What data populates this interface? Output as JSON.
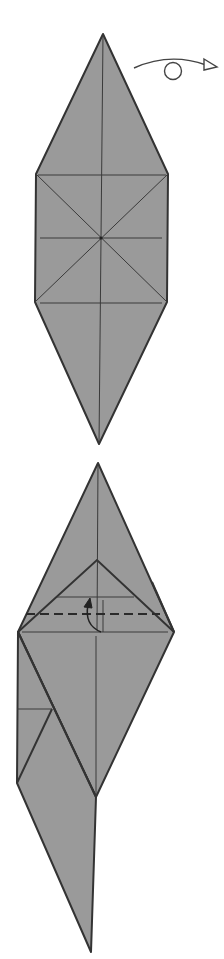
{
  "diagram": {
    "type": "origami-instructions",
    "colors": {
      "paper": "#9a9a9a",
      "edge": "#333333",
      "crease": "#3a3a3a",
      "background": "#ffffff"
    },
    "steps": [
      {
        "id": "step-1",
        "description": "Creased diamond base with turn-over symbol",
        "symbols": [
          "turn-over-arrow"
        ]
      },
      {
        "id": "step-2",
        "description": "Partially folded model with valley fold line and fold-up arrow",
        "symbols": [
          "valley-fold-dashed-line",
          "fold-up-arrow"
        ]
      }
    ]
  }
}
